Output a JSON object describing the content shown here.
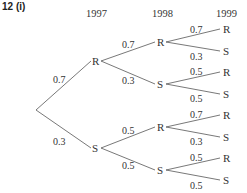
{
  "title": "12  (i)",
  "years": [
    "1997",
    "1998",
    "1999"
  ],
  "root_branches": [
    {
      "prob": "0.7",
      "node": "R"
    },
    {
      "prob": "0.3",
      "node": "S"
    }
  ],
  "level2": [
    {
      "prob": "0.7",
      "node": "R"
    },
    {
      "prob": "0.3",
      "node": "S"
    },
    {
      "prob": "0.5",
      "node": "R"
    },
    {
      "prob": "0.5",
      "node": "S"
    }
  ],
  "level3": [
    {
      "prob": "0.7",
      "node": "R"
    },
    {
      "prob": "0.3",
      "node": "S"
    },
    {
      "prob": "0.5",
      "node": "R"
    },
    {
      "prob": "0.5",
      "node": "S"
    },
    {
      "prob": "0.7",
      "node": "R"
    },
    {
      "prob": "0.3",
      "node": "S"
    },
    {
      "prob": "0.5",
      "node": "R"
    },
    {
      "prob": "0.5",
      "node": "S"
    }
  ]
}
